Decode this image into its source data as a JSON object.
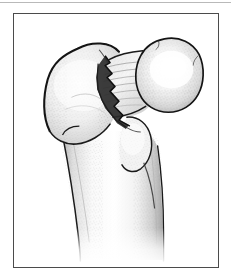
{
  "figure": {
    "domain_kind": "medical-illustration",
    "alt_text": "Line-and-stipple anatomical drawing of the upper end of a femur, viewed from the front, showing a displaced fracture line across the femoral neck",
    "frame": {
      "border_color": "#4b4b4b",
      "background_color": "#ffffff",
      "left": 13,
      "top": 13,
      "width": 206,
      "height": 255
    },
    "top_rule": {
      "color": "#b9b9b9",
      "y": 2
    },
    "palette": {
      "outline": "#1a1a1a",
      "bone_fill": "#fbfbfb",
      "shadow_light": "#e4e4e4",
      "shadow_mid": "#c9c9c9",
      "shadow_dark": "#9a9a9a",
      "stipple": "#8d8d8d",
      "fracture_gap": "#2b2b2b",
      "highlight": "#ffffff",
      "trabecular_line": "#8b8b8b"
    },
    "parts": [
      {
        "id": "femoral-head",
        "label": "Femoral head"
      },
      {
        "id": "femoral-neck",
        "label": "Femoral neck"
      },
      {
        "id": "greater-trochanter",
        "label": "Greater trochanter"
      },
      {
        "id": "lesser-trochanter",
        "label": "Lesser trochanter"
      },
      {
        "id": "femoral-shaft",
        "label": "Femoral shaft"
      },
      {
        "id": "fracture-line",
        "label": "Fracture line"
      }
    ]
  }
}
